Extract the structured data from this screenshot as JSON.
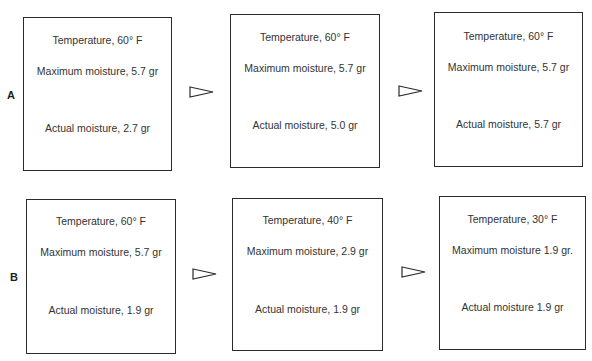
{
  "diagram": {
    "rows": [
      {
        "label": "A",
        "boxes": [
          {
            "temperature": "Temperature, 60° F",
            "maximum_moisture": "Maximum moisture, 5.7 gr",
            "actual_moisture": "Actual moisture, 2.7 gr"
          },
          {
            "temperature": "Temperature, 60° F",
            "maximum_moisture": "Maximum moisture, 5.7 gr",
            "actual_moisture": "Actual moisture, 5.0 gr"
          },
          {
            "temperature": "Temperature, 60° F",
            "maximum_moisture": "Maximum moisture, 5.7 gr",
            "actual_moisture": "Actual moisture, 5.7 gr"
          }
        ],
        "arrows": [
          "arrow-right-outline-icon",
          "arrow-right-outline-icon"
        ]
      },
      {
        "label": "B",
        "boxes": [
          {
            "temperature": "Temperature, 60° F",
            "maximum_moisture": "Maximum moisture, 5.7 gr",
            "actual_moisture": "Actual moisture, 1.9 gr"
          },
          {
            "temperature": "Temperature, 40° F",
            "maximum_moisture": "Maximum moisture, 2.9 gr",
            "actual_moisture": "Actual moisture, 1.9 gr"
          },
          {
            "temperature": "Temperature, 30° F",
            "maximum_moisture": "Maximum moisture 1.9 gr.",
            "actual_moisture": "Actual moisture 1.9 gr"
          }
        ],
        "arrows": [
          "arrow-right-outline-icon",
          "arrow-right-outline-icon"
        ]
      }
    ],
    "colors": {
      "border": "#2b2b2b",
      "text": "#333333",
      "background": "#ffffff"
    }
  }
}
